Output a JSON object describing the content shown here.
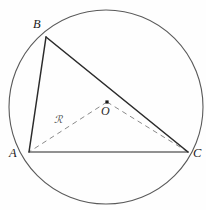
{
  "figure": {
    "canvas": {
      "width": 206,
      "height": 210,
      "background": "#fefefe"
    },
    "circle": {
      "name": "circumcircle",
      "cx": 106,
      "cy": 107,
      "r": 97,
      "stroke": "#5a5a5a",
      "stroke_width": 1.1,
      "fill": "none"
    },
    "points": {
      "A": {
        "label": "A",
        "x": 29,
        "y": 152,
        "label_x": 9,
        "label_y": 147
      },
      "B": {
        "label": "B",
        "x": 46,
        "y": 37,
        "label_x": 33,
        "label_y": 18
      },
      "C": {
        "label": "C",
        "x": 188,
        "y": 152,
        "label_x": 193,
        "label_y": 147
      },
      "O": {
        "label": "O",
        "x": 107,
        "y": 102,
        "label_x": 101,
        "label_y": 105
      }
    },
    "center_marker": {
      "name": "center-dot",
      "x": 107,
      "y": 102,
      "size": 3.2,
      "color": "#1b1b1b"
    },
    "solid_edges": [
      {
        "name": "segment-AB",
        "from": "A",
        "to": "B",
        "stroke": "#2b2b2b",
        "stroke_width": 1.5
      },
      {
        "name": "segment-BC",
        "from": "B",
        "to": "C",
        "stroke": "#2b2b2b",
        "stroke_width": 1.6
      },
      {
        "name": "segment-AC",
        "from": "A",
        "to": "C",
        "stroke": "#6e6e6e",
        "stroke_width": 1.5
      }
    ],
    "dashed_edges": [
      {
        "name": "radius-OA",
        "from": "O",
        "to": "A",
        "stroke": "#8a8a8a",
        "stroke_width": 1.0,
        "dash": "5 4"
      },
      {
        "name": "radius-OC",
        "from": "O",
        "to": "C",
        "stroke": "#8a8a8a",
        "stroke_width": 1.0,
        "dash": "5 4"
      }
    ],
    "radius_label": {
      "text": "ℛ",
      "x": 54,
      "y": 114,
      "color": "#4a4a4a"
    }
  }
}
